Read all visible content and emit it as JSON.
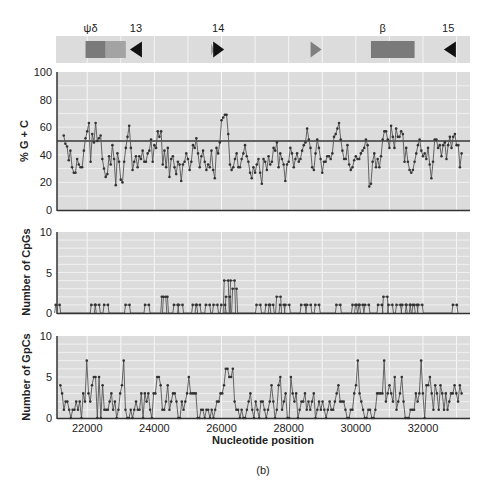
{
  "figure": {
    "caption": "(b)",
    "xlabel": "Nucleotide position",
    "x_ticks": [
      "22000",
      "24000",
      "26000",
      "28000",
      "30000",
      "32000"
    ],
    "x_tick_values": [
      22000,
      24000,
      26000,
      28000,
      30000,
      32000
    ],
    "x_range": [
      21100,
      33400
    ]
  },
  "gene_map": {
    "labels": [
      {
        "text": "ψδ",
        "pos": 22100
      },
      {
        "text": "13",
        "pos": 23450
      },
      {
        "text": "14",
        "pos": 25900
      },
      {
        "text": "β",
        "pos": 30800
      },
      {
        "text": "15",
        "pos": 32750
      }
    ],
    "features": [
      {
        "type": "box",
        "name": "psi-delta-globin-left",
        "start": 21950,
        "end": 22550,
        "color": "#7a7a7a"
      },
      {
        "type": "box",
        "name": "psi-delta-globin-right",
        "start": 22550,
        "end": 23150,
        "color": "#a3a3a3"
      },
      {
        "type": "arrow-left",
        "name": "repeat-13",
        "pos": 23450,
        "color": "#111111"
      },
      {
        "type": "arrow-right-faint",
        "name": "repeat-14-faint",
        "pos": 25720,
        "color": "#9a9a9a"
      },
      {
        "type": "arrow-right",
        "name": "repeat-14",
        "pos": 25900,
        "color": "#111111"
      },
      {
        "type": "arrow-right",
        "name": "repeat-grey",
        "pos": 28800,
        "color": "#7f7f7f"
      },
      {
        "type": "box",
        "name": "beta-globin",
        "start": 30450,
        "end": 31750,
        "color": "#7a7a7a"
      },
      {
        "type": "arrow-left",
        "name": "repeat-15",
        "pos": 32800,
        "color": "#111111"
      }
    ]
  },
  "chart_data": [
    {
      "type": "line",
      "title": "",
      "ylabel": "% G + C",
      "xlabel": "Nucleotide position",
      "ylim": [
        0,
        100
      ],
      "y_ticks": [
        0,
        20,
        40,
        60,
        80,
        100
      ],
      "grid": true,
      "reference_line": 50,
      "x_start": 21300,
      "x_end": 33150,
      "values": [
        54,
        48,
        46,
        36,
        43,
        31,
        27,
        27,
        37,
        33,
        31,
        31,
        43,
        52,
        57,
        63,
        35,
        55,
        49,
        63,
        50,
        52,
        54,
        37,
        30,
        24,
        26,
        39,
        33,
        47,
        37,
        18,
        41,
        35,
        22,
        20,
        35,
        45,
        53,
        61,
        45,
        29,
        35,
        39,
        31,
        39,
        37,
        43,
        35,
        35,
        41,
        43,
        51,
        35,
        47,
        45,
        57,
        53,
        57,
        33,
        43,
        31,
        45,
        24,
        37,
        39,
        31,
        26,
        35,
        33,
        21,
        33,
        35,
        41,
        37,
        29,
        35,
        47,
        45,
        52,
        41,
        31,
        39,
        43,
        35,
        29,
        33,
        31,
        43,
        29,
        23,
        45,
        41,
        49,
        65,
        67,
        69,
        69,
        55,
        33,
        29,
        31,
        37,
        41,
        31,
        31,
        37,
        41,
        47,
        39,
        35,
        27,
        23,
        31,
        27,
        33,
        37,
        27,
        19,
        37,
        35,
        29,
        39,
        33,
        35,
        45,
        43,
        49,
        31,
        41,
        37,
        33,
        21,
        33,
        35,
        45,
        41,
        31,
        37,
        41,
        35,
        37,
        43,
        47,
        49,
        59,
        51,
        45,
        31,
        29,
        41,
        51,
        45,
        37,
        27,
        35,
        35,
        39,
        39,
        37,
        41,
        53,
        55,
        59,
        63,
        51,
        43,
        37,
        37,
        47,
        33,
        29,
        31,
        36,
        39,
        37,
        37,
        41,
        43,
        45,
        51,
        47,
        17,
        19,
        35,
        41,
        31,
        37,
        31,
        39,
        51,
        57,
        57,
        51,
        45,
        61,
        53,
        45,
        59,
        53,
        53,
        57,
        55,
        35,
        45,
        35,
        29,
        27,
        29,
        35,
        41,
        47,
        51,
        43,
        39,
        41,
        37,
        45,
        33,
        23,
        35,
        51,
        51,
        45,
        47,
        39,
        47,
        49,
        37,
        47,
        53,
        45,
        53,
        55,
        47,
        47,
        31,
        41
      ],
      "marker": "dot"
    },
    {
      "type": "line",
      "title": "",
      "ylabel": "Number of CpGs",
      "ylim": [
        0,
        10
      ],
      "y_ticks": [
        0,
        5,
        10
      ],
      "grid": true,
      "x_start": 21100,
      "x_end": 33400,
      "peaks": [
        {
          "pos": 21120,
          "value": 1
        },
        {
          "pos": 22180,
          "value": 1
        },
        {
          "pos": 22300,
          "value": 1
        },
        {
          "pos": 22560,
          "value": 1
        },
        {
          "pos": 23200,
          "value": 1
        },
        {
          "pos": 23780,
          "value": 1
        },
        {
          "pos": 24280,
          "value": 2
        },
        {
          "pos": 24330,
          "value": 2
        },
        {
          "pos": 24640,
          "value": 1
        },
        {
          "pos": 24780,
          "value": 1
        },
        {
          "pos": 25200,
          "value": 1
        },
        {
          "pos": 25300,
          "value": 1
        },
        {
          "pos": 25590,
          "value": 1
        },
        {
          "pos": 25820,
          "value": 1
        },
        {
          "pos": 26050,
          "value": 1
        },
        {
          "pos": 26140,
          "value": 4
        },
        {
          "pos": 26190,
          "value": 2
        },
        {
          "pos": 26330,
          "value": 4
        },
        {
          "pos": 26390,
          "value": 3
        },
        {
          "pos": 27100,
          "value": 1
        },
        {
          "pos": 27380,
          "value": 1
        },
        {
          "pos": 27480,
          "value": 1
        },
        {
          "pos": 27700,
          "value": 2
        },
        {
          "pos": 27800,
          "value": 1
        },
        {
          "pos": 27960,
          "value": 1
        },
        {
          "pos": 28430,
          "value": 1
        },
        {
          "pos": 28600,
          "value": 1
        },
        {
          "pos": 28850,
          "value": 1
        },
        {
          "pos": 29480,
          "value": 1
        },
        {
          "pos": 29960,
          "value": 1
        },
        {
          "pos": 30050,
          "value": 1
        },
        {
          "pos": 30150,
          "value": 1
        },
        {
          "pos": 30330,
          "value": 1
        },
        {
          "pos": 30720,
          "value": 1
        },
        {
          "pos": 30880,
          "value": 2
        },
        {
          "pos": 31030,
          "value": 1
        },
        {
          "pos": 31270,
          "value": 1
        },
        {
          "pos": 31440,
          "value": 1
        },
        {
          "pos": 31560,
          "value": 1
        },
        {
          "pos": 31680,
          "value": 1
        },
        {
          "pos": 31760,
          "value": 1
        },
        {
          "pos": 31920,
          "value": 1
        },
        {
          "pos": 32950,
          "value": 1
        }
      ],
      "marker": "dot"
    },
    {
      "type": "line",
      "title": "",
      "ylabel": "Number of GpCs",
      "xlabel": "Nucleotide position",
      "ylim": [
        0,
        10
      ],
      "y_ticks": [
        0,
        5,
        10
      ],
      "grid": true,
      "x_start": 21200,
      "x_end": 33150,
      "values": [
        4,
        3,
        1,
        2,
        2,
        1,
        0,
        1,
        1,
        2,
        1,
        2,
        0,
        3,
        2,
        7,
        3,
        2,
        4,
        5,
        5,
        0,
        5,
        0,
        4,
        1,
        1,
        1,
        2,
        3,
        1,
        2,
        0,
        1,
        3,
        4,
        7,
        1,
        0,
        0,
        1,
        0,
        1,
        2,
        1,
        1,
        3,
        0,
        3,
        2,
        3,
        1,
        0,
        3,
        3,
        5,
        5,
        4,
        1,
        1,
        2,
        4,
        1,
        2,
        3,
        3,
        2,
        0,
        0,
        2,
        1,
        2,
        3,
        5,
        3,
        3,
        3,
        3,
        0,
        0,
        1,
        1,
        0,
        1,
        1,
        0,
        1,
        0,
        1,
        2,
        2,
        3,
        3,
        4,
        6,
        6,
        5,
        5,
        6,
        2,
        1,
        1,
        0,
        1,
        0,
        0,
        1,
        2,
        3,
        1,
        0,
        2,
        1,
        0,
        2,
        2,
        1,
        0,
        1,
        2,
        4,
        2,
        0,
        1,
        4,
        5,
        1,
        2,
        3,
        0,
        0,
        5,
        3,
        2,
        3,
        0,
        1,
        2,
        2,
        3,
        1,
        2,
        1,
        2,
        3,
        0,
        1,
        2,
        1,
        2,
        1,
        0,
        1,
        2,
        1,
        1,
        2,
        3,
        4,
        2,
        2,
        2,
        1,
        0,
        0,
        1,
        1,
        3,
        4,
        7,
        3,
        2,
        1,
        0,
        0,
        1,
        1,
        0,
        0,
        1,
        3,
        3,
        3,
        3,
        7,
        2,
        3,
        4,
        3,
        2,
        5,
        1,
        2,
        3,
        5,
        2,
        0,
        0,
        0,
        1,
        1,
        1,
        3,
        2,
        3,
        7,
        3,
        0,
        4,
        4,
        5,
        3,
        1,
        4,
        3,
        1,
        4,
        3,
        1,
        3,
        1,
        2,
        3,
        3,
        4,
        3,
        2,
        4,
        3
      ]
    }
  ]
}
